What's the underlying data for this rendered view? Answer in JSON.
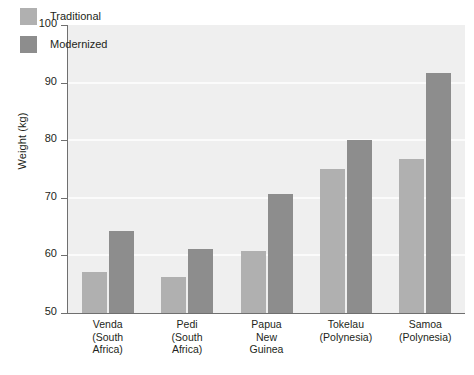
{
  "chart_data": {
    "type": "bar",
    "title": "",
    "subtitle": "",
    "xlabel": "",
    "ylabel": "Weight (kg)",
    "ylim": [
      50,
      100
    ],
    "ytick_values": [
      100,
      90,
      80,
      70,
      60,
      50
    ],
    "ytick_labels": [
      "100",
      "90",
      "80",
      "70",
      "60",
      "50"
    ],
    "grid": true,
    "grid_axis": "y",
    "legend_position": "top-left",
    "categories": [
      "Venda\n(South\nAfrica)",
      "Pedi\n(South\nAfrica)",
      "Papua\nNew\nGuinea",
      "Tokelau\n(Polynesia)",
      "Samoa\n(Polynesia)"
    ],
    "category_lines": [
      [
        "Venda",
        "(South",
        "Africa)"
      ],
      [
        "Pedi",
        "(South",
        "Africa)"
      ],
      [
        "Papua",
        "New",
        "Guinea"
      ],
      [
        "Tokelau",
        "(Polynesia)"
      ],
      [
        "Samoa",
        "(Polynesia)"
      ]
    ],
    "series": [
      {
        "name": "Traditional",
        "color": "#b0b0b0",
        "values": [
          57.2,
          56.3,
          60.8,
          75.0,
          76.8
        ]
      },
      {
        "name": "Modernized",
        "color": "#8d8d8d",
        "values": [
          64.3,
          61.1,
          70.6,
          80.1,
          91.7
        ]
      }
    ]
  },
  "legend": {
    "items": [
      {
        "label": "Traditional",
        "color": "#b0b0b0"
      },
      {
        "label": "Modernized",
        "color": "#8d8d8d"
      }
    ]
  },
  "axes": {
    "y_title": "Weight (kg)"
  },
  "colors": {
    "plot_background": "#efefef",
    "gridline": "#fbfbfb",
    "axis": "#6f6f6f",
    "text": "#231f20",
    "traditional": "#b0b0b0",
    "modernized": "#8d8d8d"
  }
}
